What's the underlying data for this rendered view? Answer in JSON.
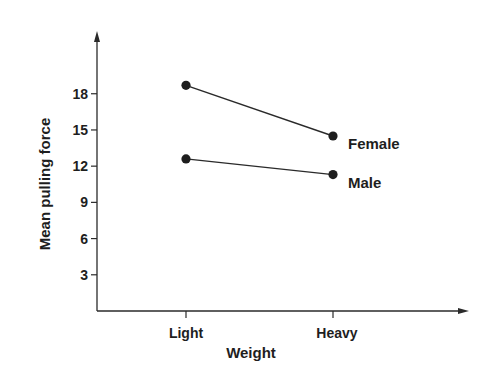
{
  "chart_data": {
    "type": "line",
    "title": "",
    "xlabel": "Weight",
    "ylabel": "Mean pulling force",
    "categories": [
      "Light",
      "Heavy"
    ],
    "series": [
      {
        "name": "Female",
        "values": [
          18.7,
          14.5
        ]
      },
      {
        "name": "Male",
        "values": [
          12.6,
          11.3
        ]
      }
    ],
    "yticks": [
      3,
      6,
      9,
      12,
      15,
      18
    ],
    "ylim": [
      0,
      23
    ],
    "grid": false,
    "legend": "inline labels at right end of each line",
    "colors": {
      "ink": "#1e1e1e",
      "background": "#ffffff"
    }
  }
}
